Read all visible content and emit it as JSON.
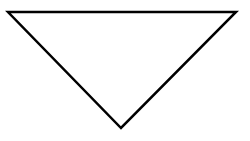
{
  "diagram": {
    "shape": "inverted-triangle",
    "stroke_color": "#000000",
    "fill_color": "#ffffff",
    "background": "#ffffff",
    "points": "8,12 236,12 121,128"
  }
}
